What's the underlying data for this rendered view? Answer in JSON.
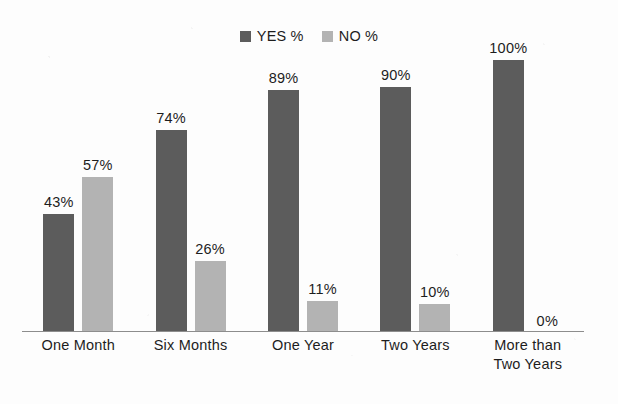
{
  "chart_data": {
    "type": "bar",
    "title": "",
    "subtitle": "",
    "xlabel": "",
    "ylabel": "",
    "ylim": [
      0,
      100
    ],
    "grid": false,
    "legend_position": "top-center",
    "categories": [
      "One Month",
      "Six Months",
      "One Year",
      "Two Years",
      "More than Two Years"
    ],
    "category_lines": [
      [
        "One Month"
      ],
      [
        "Six Months"
      ],
      [
        "One Year"
      ],
      [
        "Two Years"
      ],
      [
        "More than",
        "Two Years"
      ]
    ],
    "series": [
      {
        "name": "YES %",
        "color": "#5c5c5c",
        "values": [
          43,
          74,
          89,
          90,
          100
        ],
        "labels": [
          "43%",
          "74%",
          "89%",
          "90%",
          "100%"
        ]
      },
      {
        "name": "NO %",
        "color": "#b3b3b3",
        "values": [
          57,
          26,
          11,
          10,
          0
        ],
        "labels": [
          "57%",
          "26%",
          "11%",
          "10%",
          "0%"
        ]
      }
    ],
    "annotations": []
  },
  "legend": {
    "items": [
      {
        "label": "YES %",
        "color": "#5c5c5c",
        "swatch_name": "legend-swatch-yes"
      },
      {
        "label": "NO %",
        "color": "#b3b3b3",
        "swatch_name": "legend-swatch-no"
      }
    ]
  },
  "axis": {
    "baseline_color": "#8d8d8d"
  }
}
